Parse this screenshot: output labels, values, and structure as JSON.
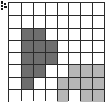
{
  "figure": {
    "kind": "grid-polyomino-diagram",
    "corner_marker": "small-black-tick-mark",
    "grid": {
      "columns": 8,
      "rows": 8,
      "line_color": "#2b2b2b",
      "background_color": "#ffffff"
    },
    "colors": {
      "dark_fill": "#6e6e6e",
      "light_fill": "#b6b6b6",
      "empty_fill": "#ffffff",
      "grid_line": "#2b2b2b",
      "marker": "#1a1a1a"
    },
    "legend": {
      "dark_region_label": "dark-gray-region",
      "light_region_label": "light-gray-region"
    }
  },
  "chart_data": {
    "type": "heatmap",
    "title": "",
    "xlabel": "",
    "ylabel": "",
    "columns": 8,
    "rows": 8,
    "x": [
      0,
      1,
      2,
      3,
      4,
      5,
      6,
      7
    ],
    "y": [
      0,
      1,
      2,
      3,
      4,
      5,
      6,
      7
    ],
    "xtick_labels": [
      "",
      "",
      "",
      "",
      "",
      "",
      "",
      ""
    ],
    "ytick_labels": [
      "",
      "",
      "",
      "",
      "",
      "",
      "",
      ""
    ],
    "grid": true,
    "legend_position": "none",
    "value_map": {
      "0": "empty",
      "1": "dark",
      "2": "light"
    },
    "color_map": {
      "empty": "#ffffff",
      "dark": "#6e6e6e",
      "light": "#b6b6b6"
    },
    "values": [
      [
        0,
        0,
        0,
        0,
        0,
        0,
        0,
        0
      ],
      [
        0,
        0,
        0,
        0,
        0,
        0,
        0,
        0
      ],
      [
        0,
        1,
        1,
        0,
        0,
        0,
        0,
        0
      ],
      [
        0,
        1,
        1,
        1,
        0,
        0,
        0,
        0
      ],
      [
        0,
        1,
        1,
        1,
        0,
        0,
        0,
        0
      ],
      [
        0,
        1,
        1,
        0,
        0,
        2,
        2,
        2
      ],
      [
        0,
        1,
        0,
        0,
        2,
        2,
        2,
        2
      ],
      [
        0,
        0,
        0,
        0,
        2,
        0,
        2,
        2
      ]
    ],
    "dark_cells": [
      [
        1,
        2
      ],
      [
        2,
        2
      ],
      [
        1,
        3
      ],
      [
        2,
        3
      ],
      [
        3,
        3
      ],
      [
        1,
        4
      ],
      [
        2,
        4
      ],
      [
        3,
        4
      ],
      [
        1,
        5
      ],
      [
        2,
        5
      ],
      [
        1,
        6
      ]
    ],
    "light_cells": [
      [
        5,
        5
      ],
      [
        6,
        5
      ],
      [
        7,
        5
      ],
      [
        4,
        6
      ],
      [
        5,
        6
      ],
      [
        6,
        6
      ],
      [
        7,
        6
      ],
      [
        4,
        7
      ],
      [
        6,
        7
      ],
      [
        7,
        7
      ]
    ],
    "dark_cell_count": 11,
    "light_cell_count": 10,
    "empty_cell_count": 43
  }
}
